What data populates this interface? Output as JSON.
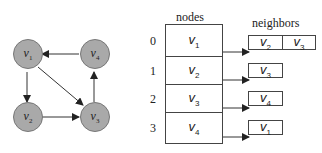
{
  "graph": {
    "nodes": [
      {
        "id": "v1",
        "base": "v",
        "sub": "1"
      },
      {
        "id": "v2",
        "base": "v",
        "sub": "2"
      },
      {
        "id": "v3",
        "base": "v",
        "sub": "3"
      },
      {
        "id": "v4",
        "base": "v",
        "sub": "4"
      }
    ],
    "edges": [
      {
        "from": "v1",
        "to": "v2"
      },
      {
        "from": "v1",
        "to": "v3"
      },
      {
        "from": "v2",
        "to": "v3"
      },
      {
        "from": "v3",
        "to": "v4"
      },
      {
        "from": "v4",
        "to": "v1"
      }
    ],
    "node_color": "#a9a9a9"
  },
  "table": {
    "nodes_header": "nodes",
    "neighbors_header": "neighbors",
    "rows": [
      {
        "index": "0",
        "node": {
          "base": "v",
          "sub": "1"
        },
        "neighbors": [
          {
            "base": "v",
            "sub": "2"
          },
          {
            "base": "v",
            "sub": "3"
          }
        ]
      },
      {
        "index": "1",
        "node": {
          "base": "v",
          "sub": "2"
        },
        "neighbors": [
          {
            "base": "v",
            "sub": "3"
          }
        ]
      },
      {
        "index": "2",
        "node": {
          "base": "v",
          "sub": "3"
        },
        "neighbors": [
          {
            "base": "v",
            "sub": "4"
          }
        ]
      },
      {
        "index": "3",
        "node": {
          "base": "v",
          "sub": "4"
        },
        "neighbors": [
          {
            "base": "v",
            "sub": "1"
          }
        ]
      }
    ]
  }
}
